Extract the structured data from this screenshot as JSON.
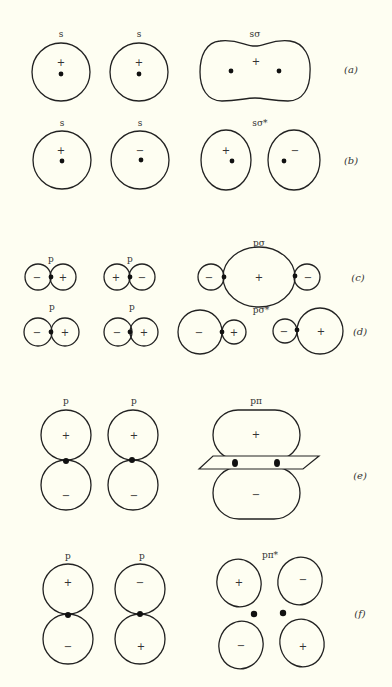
{
  "figure": {
    "rows": [
      {
        "id": "a",
        "label": "(a)",
        "orbital_1": "s",
        "orbital_2": "s",
        "result": "sσ",
        "signs_1": [
          "+"
        ],
        "signs_2": [
          "+"
        ],
        "signs_result": [
          "+"
        ]
      },
      {
        "id": "b",
        "label": "(b)",
        "orbital_1": "s",
        "orbital_2": "s",
        "result": "sσ*",
        "signs_1": [
          "+"
        ],
        "signs_2": [
          "−"
        ],
        "signs_result": [
          "+",
          "−"
        ]
      },
      {
        "id": "c",
        "label": "(c)",
        "orbital_1": "p",
        "orbital_2": "p",
        "result": "pσ",
        "signs_1": [
          "−",
          "+"
        ],
        "signs_2": [
          "+",
          "−"
        ],
        "signs_result": [
          "−",
          "+",
          "−"
        ]
      },
      {
        "id": "d",
        "label": "(d)",
        "orbital_1": "p",
        "orbital_2": "p",
        "result": "pσ*",
        "signs_1": [
          "−",
          "+"
        ],
        "signs_2": [
          "−",
          "+"
        ],
        "signs_result": [
          "−",
          "+",
          "−",
          "+"
        ]
      },
      {
        "id": "e",
        "label": "(e)",
        "orbital_1": "p",
        "orbital_2": "p",
        "result": "pπ",
        "signs_1": [
          "+",
          "−"
        ],
        "signs_2": [
          "+",
          "−"
        ],
        "signs_result": [
          "+",
          "−"
        ]
      },
      {
        "id": "f",
        "label": "(f)",
        "orbital_1": "p",
        "orbital_2": "p",
        "result": "pπ*",
        "signs_1": [
          "+",
          "−"
        ],
        "signs_2": [
          "−",
          "+"
        ],
        "signs_result": [
          "+",
          "−",
          "−",
          "+"
        ]
      }
    ]
  }
}
